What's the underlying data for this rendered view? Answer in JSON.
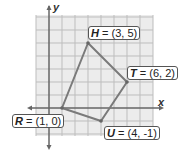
{
  "diagram": {
    "axes": {
      "x_label": "x",
      "y_label": "y"
    },
    "points": [
      {
        "name": "H",
        "coord": "(3, 5)",
        "x": 3,
        "y": 5
      },
      {
        "name": "T",
        "coord": "(6, 2)",
        "x": 6,
        "y": 2
      },
      {
        "name": "U",
        "coord": "(4, -1)",
        "x": 4,
        "y": -1
      },
      {
        "name": "R",
        "coord": "(1, 0)",
        "x": 1,
        "y": 0
      }
    ],
    "colors": {
      "grid": "#bbbbbb",
      "grid_bg": "#ececec",
      "axis": "#666666",
      "polygon": "#7a7a7a"
    }
  }
}
